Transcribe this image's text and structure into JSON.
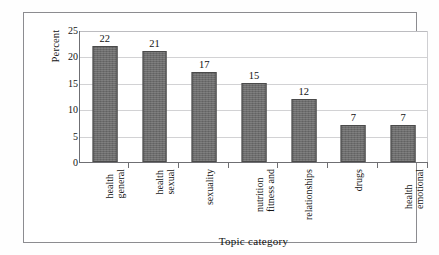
{
  "chart_data": {
    "type": "bar",
    "title": "",
    "subtitle": "",
    "xlabel": "Topic category",
    "ylabel": "Percent",
    "categories": [
      "general health",
      "sexual health",
      "sexuality",
      "fitness and nutrition",
      "relationships",
      "drugs",
      "emotional health"
    ],
    "category_label_lines": [
      [
        "general",
        "health"
      ],
      [
        "sexual",
        "health"
      ],
      [
        "sexuality"
      ],
      [
        "fitness and",
        "nutrition"
      ],
      [
        "relationships"
      ],
      [
        "drugs"
      ],
      [
        "emotional",
        "health"
      ]
    ],
    "values": [
      22,
      21,
      17,
      15,
      12,
      7,
      7
    ],
    "data_labels": [
      "22",
      "21",
      "17",
      "15",
      "12",
      "7",
      "7"
    ],
    "ylim": [
      0,
      25
    ],
    "ytick_values": [
      0,
      5,
      10,
      15,
      20,
      25
    ],
    "ytick_labels": [
      "0",
      "5",
      "10",
      "15",
      "20",
      "25"
    ],
    "grid": "horizontal",
    "legend": "none",
    "bar_color": "#6d6d6d",
    "bar_border_color": "#4a4a4a",
    "gridline_color": "#d2d2d4",
    "axis_color": "#6f6f73",
    "frame_color": "#8c8c90",
    "background_color": "#ffffff"
  }
}
